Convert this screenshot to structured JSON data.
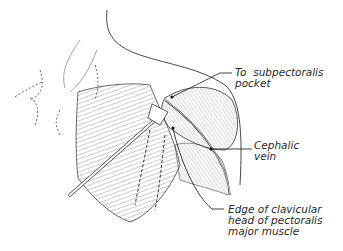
{
  "figure": {
    "labels": [
      {
        "id": "subpectoralis",
        "line1": "To  subpectoralis",
        "line2": "pocket"
      },
      {
        "id": "cephalic",
        "line1": "Cephalic",
        "line2": "vein"
      },
      {
        "id": "pectoralis",
        "line1": "Edge of clavicular",
        "line2": "head of pectoralis",
        "line3": "major muscle"
      }
    ]
  }
}
